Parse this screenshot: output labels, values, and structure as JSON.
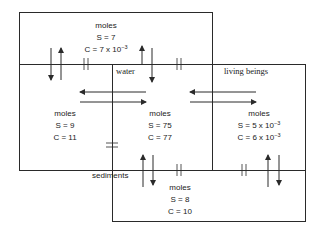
{
  "compartments": {
    "air": {
      "unit": "moles",
      "s": "S = 7",
      "c_base": "C = 7 x 10",
      "c_exp": "−3"
    },
    "soil": {
      "unit": "moles",
      "s": "S = 9",
      "c": "C = 11"
    },
    "water": {
      "label": "water",
      "unit": "moles",
      "s": "S = 75",
      "c": "C = 77"
    },
    "living_beings": {
      "label": "living beings",
      "unit": "moles",
      "s_base": "S = 5 x 10",
      "s_exp": "−3",
      "c_base": "C = 6 x 10",
      "c_exp": "−3"
    },
    "sediments": {
      "label": "sediments",
      "unit": "moles",
      "s": "S = 8",
      "c": "C = 10"
    }
  },
  "colors": {
    "line": "#2a2a2a",
    "text": "#1a1a1a",
    "background": "#ffffff"
  }
}
